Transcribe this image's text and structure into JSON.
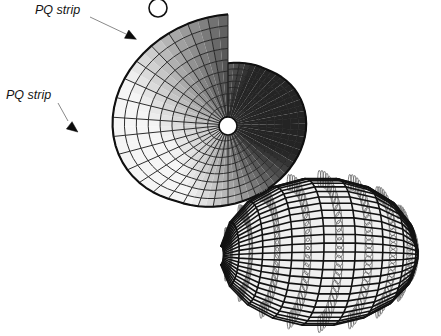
{
  "figure": {
    "name": "pq-mesh-and-circle-packing-figure",
    "background_color": "#ffffff",
    "annotations": [
      {
        "id": "annotation-pq-strip-upper",
        "label": "PQ strip",
        "text_x": 35,
        "text_y": 11,
        "leader": {
          "x1": 90,
          "y1": 17,
          "x2": 126,
          "y2": 34
        },
        "arrow": {
          "x": 132,
          "y": 37,
          "angle": 28
        },
        "icon": "arrow-pointer-icon"
      },
      {
        "id": "annotation-pq-strip-lower",
        "label": "PQ strip",
        "text_x": 6,
        "text_y": 96,
        "leader": {
          "x1": 58,
          "y1": 103,
          "x2": 68,
          "y2": 121
        },
        "arrow": {
          "x": 74,
          "y": 129,
          "angle": 38
        },
        "icon": "arrow-pointer-icon"
      }
    ],
    "upper_shape": {
      "name": "shaded-pq-quad-mesh-surface",
      "description": "Smoothly shaded planar-quad mesh surface shaped like a snail shell with two singular notches",
      "mesh_line_color": "#232323",
      "outline_color": "#101010",
      "shading": {
        "lightest": "#ededed",
        "light": "#d4d4d4",
        "mid": "#a8a8a8",
        "dark": "#6a6a6a",
        "darkest": "#3a3a3a"
      },
      "center": {
        "x": 228,
        "y": 125
      },
      "radial_lines": 36,
      "ring_lines": 9,
      "notches": [
        {
          "x": 158,
          "y": 8,
          "r": 9
        },
        {
          "x": 228,
          "y": 126,
          "r": 9
        }
      ]
    },
    "lower_shape": {
      "name": "circle-packing-conical-mesh-wireframe",
      "description": "Transparent quad mesh wireframe with inscribed circles touching edge midpoints",
      "edge_color": "#121212",
      "circle_color": "#6f6f6f",
      "face_fill": "rgba(170,170,170,0.18)",
      "center": {
        "x": 318,
        "y": 252
      },
      "rows": 7,
      "cols": 9
    }
  }
}
